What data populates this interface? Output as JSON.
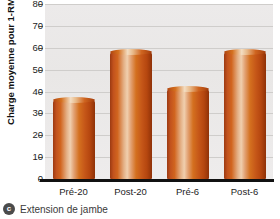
{
  "chart_data": {
    "type": "bar",
    "title": "",
    "xlabel": "",
    "ylabel": "Charge moyenne pour 1-RM (kg)",
    "categories": [
      "Pré-20",
      "Post-20",
      "Pré-6",
      "Post-6"
    ],
    "values": [
      36,
      58,
      41,
      58
    ],
    "ylim": [
      0,
      80
    ],
    "yticks": [
      0,
      10,
      20,
      30,
      40,
      50,
      60,
      70,
      80
    ],
    "ytick_labels": [
      "0",
      "10",
      "20",
      "30",
      "40",
      "50",
      "60",
      "70",
      "80"
    ],
    "grid": true,
    "legend": "none",
    "bar_color": "#c85a1a",
    "plot_background": "#ebe9e8",
    "axis_color": "#111111"
  },
  "caption": {
    "badge": "c",
    "text": "Extension de jambe"
  }
}
